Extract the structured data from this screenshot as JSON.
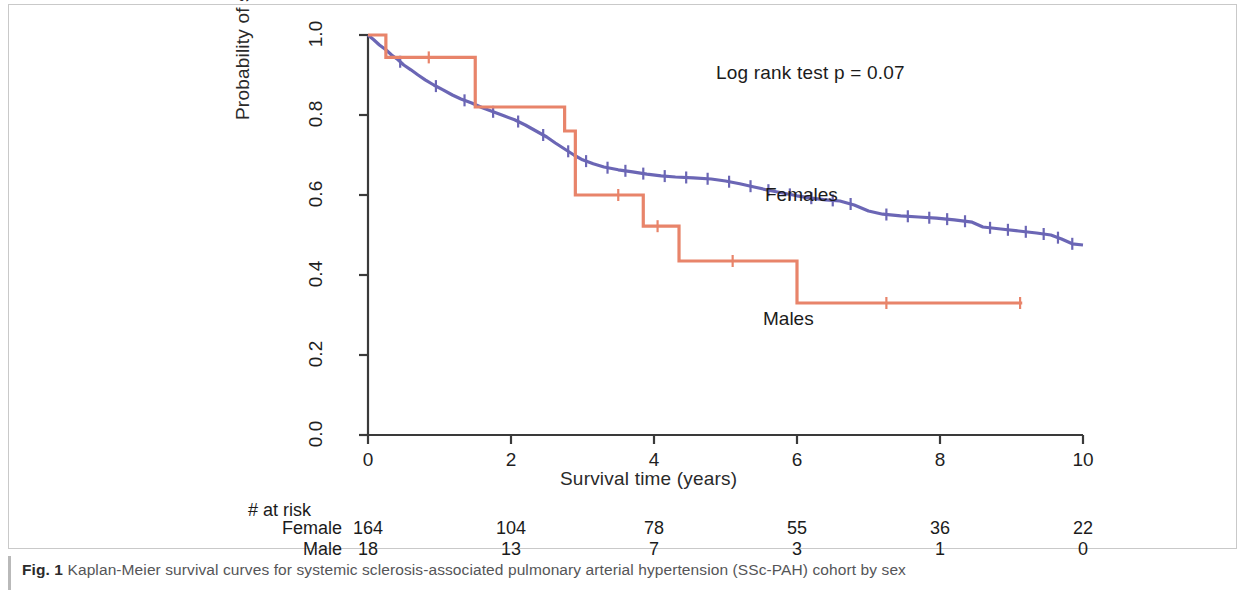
{
  "figure": {
    "caption_prefix": "Fig. 1",
    "caption_text": " Kaplan-Meier survival curves for systemic sclerosis-associated pulmonary arterial hypertension (SSc-PAH) cohort by sex"
  },
  "annotations": {
    "logrank": "Log rank test p = 0.07",
    "females_label": "Females",
    "males_label": "Males"
  },
  "risk_table": {
    "title": "# at risk",
    "rows": [
      {
        "label": "Female",
        "values": [
          "164",
          "104",
          "78",
          "55",
          "36",
          "22"
        ]
      },
      {
        "label": "Male",
        "values": [
          "18",
          "13",
          "7",
          "3",
          "1",
          "0"
        ]
      }
    ],
    "times": [
      0,
      2,
      4,
      6,
      8,
      10
    ]
  },
  "colors": {
    "females": "#6b66b5",
    "males": "#e8846a",
    "axis": "#3a3a3a",
    "text": "#1b1b1b",
    "caption": "#555557"
  },
  "chart_data": {
    "type": "line",
    "title": "",
    "xlabel": "Survival time (years)",
    "ylabel": "Probability of survival",
    "xlim": [
      0,
      10
    ],
    "ylim": [
      0,
      1
    ],
    "xticks": [
      0,
      2,
      4,
      6,
      8,
      10
    ],
    "xtick_labels": [
      "0",
      "2",
      "4",
      "6",
      "8",
      "10"
    ],
    "yticks": [
      0.0,
      0.2,
      0.4,
      0.6,
      0.8,
      1.0
    ],
    "ytick_labels": [
      "0.0",
      "0.2",
      "0.4",
      "0.6",
      "0.8",
      "1.0"
    ],
    "grid": false,
    "legend": "inline-curve-labels",
    "step_style": "post",
    "annotation": "Log rank test p = 0.07",
    "series": [
      {
        "name": "Females",
        "color": "#6b66b5",
        "label_xy": [
          5.55,
          0.6
        ],
        "points": [
          [
            0.0,
            1.0
          ],
          [
            0.08,
            0.988
          ],
          [
            0.16,
            0.975
          ],
          [
            0.25,
            0.963
          ],
          [
            0.33,
            0.95
          ],
          [
            0.42,
            0.938
          ],
          [
            0.5,
            0.925
          ],
          [
            0.6,
            0.913
          ],
          [
            0.7,
            0.9
          ],
          [
            0.8,
            0.888
          ],
          [
            0.92,
            0.875
          ],
          [
            1.05,
            0.863
          ],
          [
            1.18,
            0.85
          ],
          [
            1.3,
            0.84
          ],
          [
            1.45,
            0.83
          ],
          [
            1.6,
            0.818
          ],
          [
            1.75,
            0.808
          ],
          [
            1.9,
            0.798
          ],
          [
            2.05,
            0.788
          ],
          [
            2.2,
            0.775
          ],
          [
            2.35,
            0.76
          ],
          [
            2.5,
            0.745
          ],
          [
            2.62,
            0.73
          ],
          [
            2.75,
            0.715
          ],
          [
            2.88,
            0.7
          ],
          [
            3.0,
            0.688
          ],
          [
            3.15,
            0.678
          ],
          [
            3.3,
            0.67
          ],
          [
            3.5,
            0.663
          ],
          [
            3.7,
            0.658
          ],
          [
            3.9,
            0.652
          ],
          [
            4.1,
            0.648
          ],
          [
            4.3,
            0.645
          ],
          [
            4.55,
            0.643
          ],
          [
            4.8,
            0.64
          ],
          [
            5.0,
            0.635
          ],
          [
            5.2,
            0.628
          ],
          [
            5.4,
            0.62
          ],
          [
            5.6,
            0.612
          ],
          [
            5.8,
            0.605
          ],
          [
            6.0,
            0.598
          ],
          [
            6.2,
            0.592
          ],
          [
            6.4,
            0.588
          ],
          [
            6.6,
            0.585
          ],
          [
            6.8,
            0.575
          ],
          [
            7.0,
            0.56
          ],
          [
            7.2,
            0.552
          ],
          [
            7.45,
            0.548
          ],
          [
            7.7,
            0.545
          ],
          [
            7.95,
            0.542
          ],
          [
            8.2,
            0.538
          ],
          [
            8.45,
            0.532
          ],
          [
            8.6,
            0.52
          ],
          [
            8.85,
            0.515
          ],
          [
            9.1,
            0.51
          ],
          [
            9.35,
            0.505
          ],
          [
            9.55,
            0.5
          ],
          [
            9.7,
            0.49
          ],
          [
            9.85,
            0.478
          ],
          [
            10.0,
            0.475
          ]
        ],
        "censor_x": [
          0.45,
          0.95,
          1.35,
          1.75,
          2.1,
          2.45,
          2.8,
          3.05,
          3.35,
          3.6,
          3.85,
          4.15,
          4.45,
          4.75,
          5.05,
          5.35,
          5.6,
          5.9,
          6.2,
          6.5,
          6.75,
          7.25,
          7.55,
          7.85,
          8.1,
          8.35,
          8.7,
          8.95,
          9.2,
          9.45,
          9.65,
          9.85
        ]
      },
      {
        "name": "Males",
        "color": "#e8846a",
        "label_xy": [
          5.55,
          0.27
        ],
        "steps": [
          {
            "t": 0.0,
            "s": 1.0
          },
          {
            "t": 0.25,
            "s": 0.944
          },
          {
            "t": 1.5,
            "s": 0.82
          },
          {
            "t": 2.75,
            "s": 0.76
          },
          {
            "t": 2.9,
            "s": 0.6
          },
          {
            "t": 3.85,
            "s": 0.522
          },
          {
            "t": 4.35,
            "s": 0.435
          },
          {
            "t": 6.0,
            "s": 0.33
          },
          {
            "t": 9.15,
            "s": 0.33
          }
        ],
        "censor_x": [
          0.85,
          3.5,
          4.05,
          5.1,
          7.25,
          9.12
        ]
      }
    ]
  }
}
